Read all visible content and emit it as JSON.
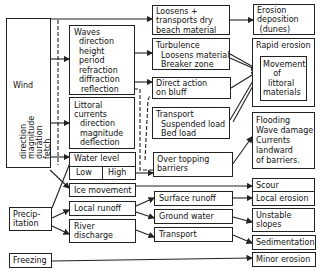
{
  "diagram": {
    "sources": {
      "wind": {
        "label": "Wind",
        "params": [
          "direction",
          "magnitude",
          "duration",
          "fetch"
        ]
      },
      "precipitation": {
        "label": "Precip-\nitation"
      },
      "freezing": {
        "label": "Freezing"
      }
    },
    "processes": {
      "waves": {
        "title": "Waves",
        "items": [
          "direction",
          "height",
          "period",
          "refraction",
          "diffraction",
          "reflection"
        ]
      },
      "littoral_currents": {
        "title": "Littoral\ncurrents",
        "items": [
          "direction",
          "magnitude",
          "deflection"
        ]
      },
      "water_level": {
        "title": "Water level",
        "low": "Low",
        "high": "High"
      },
      "ice_movement": {
        "label": "Ice movement"
      },
      "local_runoff": {
        "label": "Local runoff"
      },
      "river_discharge": {
        "label": "River\ndischarge"
      }
    },
    "mechanisms": {
      "loosens_transports": {
        "label": "Loosens +\ntransports dry\nbeach material"
      },
      "turbulence": {
        "title": "Turbulence",
        "items": [
          "Loosens material",
          "Breaker zone"
        ]
      },
      "direct_action": {
        "label": "Direct action\non bluff"
      },
      "transport_load": {
        "title": "Transport",
        "items": [
          "Suspended load",
          "Bed load"
        ]
      },
      "overtopping": {
        "label": "Over topping\nbarriers"
      },
      "surface_runoff": {
        "label": "Surface runoff"
      },
      "ground_water": {
        "label": "Ground water"
      },
      "transport": {
        "label": "Transport"
      }
    },
    "effects": {
      "erosion_deposition": {
        "label": "Erosion\ndeposition\n (dunes)"
      },
      "rapid_erosion": {
        "label": "Rapid erosion"
      },
      "movement_littoral": {
        "label": "Movement\n    of\n  littoral\nmaterials"
      },
      "flooding": {
        "label": "Flooding\nWave damage\nCurrents\nlandward\nof barriers."
      },
      "scour": {
        "label": "Scour"
      },
      "local_erosion": {
        "label": "Local erosion"
      },
      "unstable_slopes": {
        "label": "Unstable\nslopes"
      },
      "sedimentation": {
        "label": "Sedimentation"
      },
      "minor_erosion": {
        "label": "Minor erosion"
      }
    }
  },
  "colors": {
    "line": "#222222",
    "background": "#ffffff",
    "text": "#111111"
  }
}
